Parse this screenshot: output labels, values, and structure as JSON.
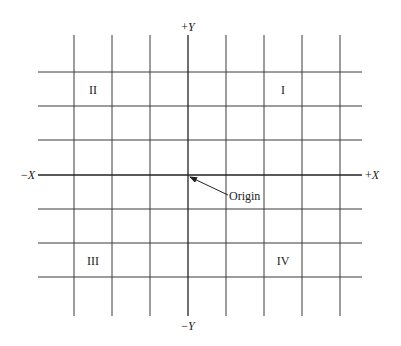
{
  "diagram": {
    "type": "cartesian-coordinate-plane",
    "axes": {
      "x_positive": "+X",
      "x_negative": "−X",
      "y_positive": "+Y",
      "y_negative": "−Y"
    },
    "origin_label": "Origin",
    "quadrants": {
      "q1": "I",
      "q2": "II",
      "q3": "III",
      "q4": "IV"
    },
    "grid": {
      "vertical_lines": 8,
      "horizontal_lines": 7
    }
  }
}
